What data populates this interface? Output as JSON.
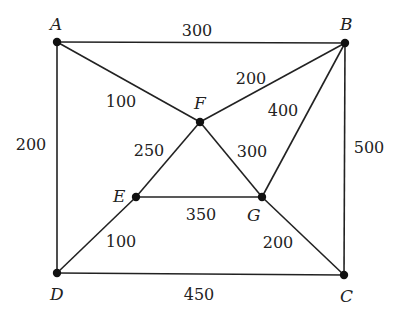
{
  "graph": {
    "type": "weighted-undirected-graph",
    "nodes": [
      {
        "id": "A",
        "label": "A",
        "x": 57,
        "y": 42,
        "lx": 50,
        "ly": 30
      },
      {
        "id": "B",
        "label": "B",
        "x": 345,
        "y": 43,
        "lx": 340,
        "ly": 30
      },
      {
        "id": "C",
        "label": "C",
        "x": 344,
        "y": 275,
        "lx": 340,
        "ly": 302
      },
      {
        "id": "D",
        "label": "D",
        "x": 57,
        "y": 273,
        "lx": 50,
        "ly": 300
      },
      {
        "id": "E",
        "label": "E",
        "x": 136,
        "y": 197,
        "lx": 113,
        "ly": 202
      },
      {
        "id": "F",
        "label": "F",
        "x": 200,
        "y": 122,
        "lx": 194,
        "ly": 109
      },
      {
        "id": "G",
        "label": "G",
        "x": 262,
        "y": 197,
        "lx": 247,
        "ly": 221
      }
    ],
    "edges": [
      {
        "from": "A",
        "to": "B",
        "weight": "300",
        "lx": 197,
        "ly": 36
      },
      {
        "from": "A",
        "to": "F",
        "weight": "100",
        "lx": 121,
        "ly": 107
      },
      {
        "from": "A",
        "to": "D",
        "weight": "200",
        "lx": 31,
        "ly": 150
      },
      {
        "from": "B",
        "to": "F",
        "weight": "200",
        "lx": 251,
        "ly": 84
      },
      {
        "from": "B",
        "to": "G",
        "weight": "400",
        "lx": 283,
        "ly": 116
      },
      {
        "from": "B",
        "to": "C",
        "weight": "500",
        "lx": 369,
        "ly": 153
      },
      {
        "from": "F",
        "to": "E",
        "weight": "250",
        "lx": 149,
        "ly": 156
      },
      {
        "from": "F",
        "to": "G",
        "weight": "300",
        "lx": 252,
        "ly": 157
      },
      {
        "from": "E",
        "to": "G",
        "weight": "350",
        "lx": 201,
        "ly": 220
      },
      {
        "from": "E",
        "to": "D",
        "weight": "100",
        "lx": 121,
        "ly": 247
      },
      {
        "from": "G",
        "to": "C",
        "weight": "200",
        "lx": 278,
        "ly": 248
      },
      {
        "from": "D",
        "to": "C",
        "weight": "450",
        "lx": 199,
        "ly": 300
      }
    ]
  }
}
